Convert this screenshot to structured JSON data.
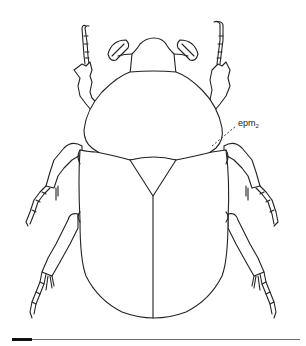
{
  "figure": {
    "label": {
      "text": "epm",
      "subscript": "2"
    },
    "scale_bar": {
      "present": true
    }
  },
  "colors": {
    "line": "#222222",
    "background": "#ffffff"
  }
}
